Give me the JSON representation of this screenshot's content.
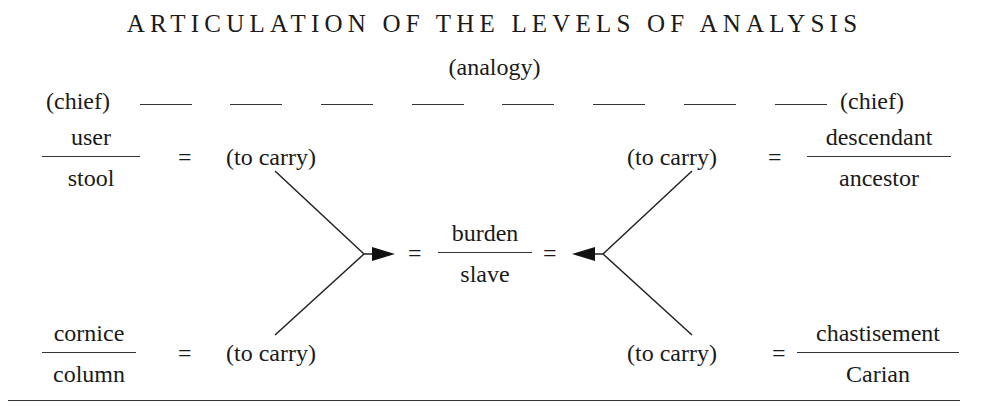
{
  "title": "ARTICULATION OF THE LEVELS OF ANALYSIS",
  "subtitle": "(analogy)",
  "chief_row": {
    "left_label": "(chief)",
    "right_label": "(chief)",
    "dash_count": 8
  },
  "equals": "=",
  "top_left": {
    "numerator": "user",
    "denominator": "stool",
    "verb": "(to carry)"
  },
  "top_right": {
    "numerator": "descendant",
    "denominator": "ancestor",
    "verb": "(to carry)"
  },
  "bottom_left": {
    "numerator": "cornice",
    "denominator": "column",
    "verb": "(to carry)"
  },
  "bottom_right": {
    "numerator": "chastisement",
    "denominator": "Carian",
    "verb": "(to carry)"
  },
  "center": {
    "numerator": "burden",
    "denominator": "slave"
  },
  "colors": {
    "ink": "#1a1a1a",
    "background": "#ffffff"
  }
}
